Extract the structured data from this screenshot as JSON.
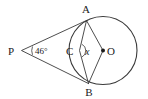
{
  "figure": {
    "type": "circle-geometry-diagram",
    "background_color": "#ffffff",
    "stroke_color": "#3a3a3a",
    "label_color": "#1a1a1a",
    "width": 148,
    "height": 99
  },
  "labels": {
    "point_p": "P",
    "point_a": "A",
    "point_b": "B",
    "point_c": "C",
    "point_o": "O",
    "angle_at_p": "46°",
    "angle_at_c": "x"
  },
  "geometry": {
    "circle": {
      "cx": 103,
      "cy": 50.5,
      "r": 34
    },
    "points": {
      "P": {
        "x": 21.5,
        "y": 50.5
      },
      "A": {
        "x": 86.5,
        "y": 20.5
      },
      "B": {
        "x": 88.5,
        "y": 83.5
      },
      "C": {
        "x": 79.5,
        "y": 50.5
      },
      "O": {
        "x": 103,
        "y": 50.5
      }
    },
    "segments": [
      {
        "name": "PA-tangent",
        "from": "P",
        "to": "A"
      },
      {
        "name": "PB-tangent",
        "from": "P",
        "to": "B"
      },
      {
        "name": "AO-radius",
        "from": "A",
        "to": "O"
      },
      {
        "name": "BO-radius",
        "from": "B",
        "to": "O"
      },
      {
        "name": "AC-chord",
        "from": "A",
        "to": "C"
      },
      {
        "name": "CB-chord",
        "from": "C",
        "to": "B"
      },
      {
        "name": "PO-axis",
        "from": "P",
        "to": "O"
      }
    ],
    "angle_marks": [
      {
        "name": "angle-mark-p",
        "at": "P",
        "value_label": "46°"
      },
      {
        "name": "angle-mark-c",
        "at": "C",
        "value_label": "x"
      }
    ]
  }
}
